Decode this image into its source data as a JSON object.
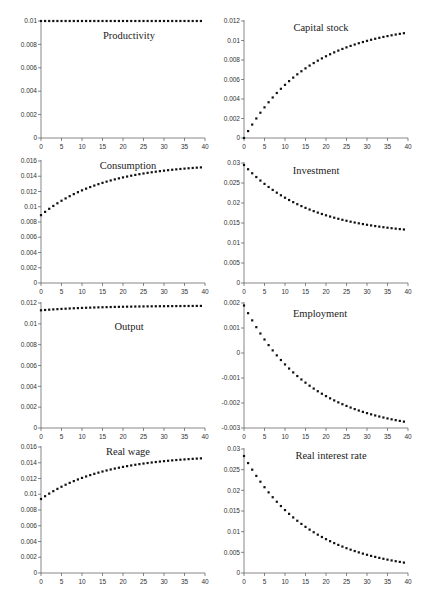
{
  "figure": {
    "layout": {
      "rows": 4,
      "cols": 2
    }
  },
  "chart_data": [
    {
      "type": "scatter",
      "title": "Productivity",
      "xlabel": "",
      "ylabel": "",
      "xlim": [
        0,
        40
      ],
      "ylim": [
        0,
        0.01
      ],
      "xticks": [
        0,
        5,
        10,
        15,
        20,
        25,
        30,
        35,
        40
      ],
      "yticks": [
        0,
        0.002,
        0.004,
        0.006,
        0.008,
        0.01
      ],
      "ytick_labels": [
        "0",
        "0.002",
        "0.004",
        "0.006",
        "0.008",
        "0.01"
      ],
      "model": {
        "kind": "const",
        "value": 0.01
      }
    },
    {
      "type": "scatter",
      "title": "Capital stock",
      "xlabel": "",
      "ylabel": "",
      "xlim": [
        0,
        40
      ],
      "ylim": [
        0,
        0.012
      ],
      "xticks": [
        0,
        5,
        10,
        15,
        20,
        25,
        30,
        35,
        40
      ],
      "yticks": [
        0,
        0.002,
        0.004,
        0.006,
        0.008,
        0.01,
        0.012
      ],
      "ytick_labels": [
        "0",
        "0.002",
        "0.004",
        "0.006",
        "0.008",
        "0.01",
        "0.012"
      ],
      "model": {
        "kind": "exp",
        "start": 0.0,
        "end": 0.0118,
        "rate": 0.062
      }
    },
    {
      "type": "scatter",
      "title": "Consumption",
      "xlabel": "",
      "ylabel": "",
      "xlim": [
        0,
        40
      ],
      "ylim": [
        0,
        0.016
      ],
      "xticks": [
        0,
        5,
        10,
        15,
        20,
        25,
        30,
        35,
        40
      ],
      "yticks": [
        0,
        0.002,
        0.004,
        0.006,
        0.008,
        0.01,
        0.012,
        0.014,
        0.016
      ],
      "ytick_labels": [
        "0",
        "0.002",
        "0.004",
        "0.006",
        "0.008",
        "0.01",
        "0.012",
        "0.014",
        "0.016"
      ],
      "model": {
        "kind": "exp",
        "start": 0.0089,
        "end": 0.0157,
        "rate": 0.065
      }
    },
    {
      "type": "scatter",
      "title": "Investment",
      "xlabel": "",
      "ylabel": "",
      "xlim": [
        0,
        40
      ],
      "ylim": [
        0,
        0.03
      ],
      "xticks": [
        0,
        5,
        10,
        15,
        20,
        25,
        30,
        35,
        40
      ],
      "yticks": [
        0,
        0.005,
        0.01,
        0.015,
        0.02,
        0.025,
        0.03
      ],
      "ytick_labels": [
        "0",
        "0.005",
        "0.01",
        "0.015",
        "0.02",
        "0.025",
        "0.03"
      ],
      "model": {
        "kind": "exp",
        "start": 0.0295,
        "end": 0.0118,
        "rate": 0.062
      }
    },
    {
      "type": "scatter",
      "title": "Output",
      "xlabel": "",
      "ylabel": "",
      "xlim": [
        0,
        40
      ],
      "ylim": [
        0,
        0.012
      ],
      "xticks": [
        0,
        5,
        10,
        15,
        20,
        25,
        30,
        35,
        40
      ],
      "yticks": [
        0,
        0.002,
        0.004,
        0.006,
        0.008,
        0.01,
        0.012
      ],
      "ytick_labels": [
        "0",
        "0.002",
        "0.004",
        "0.006",
        "0.008",
        "0.01",
        "0.012"
      ],
      "model": {
        "kind": "exp",
        "start": 0.0113,
        "end": 0.01175,
        "rate": 0.07
      }
    },
    {
      "type": "scatter",
      "title": "Employment",
      "xlabel": "",
      "ylabel": "",
      "xlim": [
        0,
        40
      ],
      "ylim": [
        -0.003,
        0.002
      ],
      "xticks": [
        0,
        5,
        10,
        15,
        20,
        25,
        30,
        35,
        40
      ],
      "yticks": [
        -0.003,
        -0.002,
        -0.001,
        0,
        0.001,
        0.002
      ],
      "ytick_labels": [
        "-0.003",
        "-0.002",
        "-0.001",
        "0",
        "0.001",
        "0.002"
      ],
      "model": {
        "kind": "exp",
        "start": 0.0019,
        "end": -0.0032,
        "rate": 0.062
      }
    },
    {
      "type": "scatter",
      "title": "Real wage",
      "xlabel": "",
      "ylabel": "",
      "xlim": [
        0,
        40
      ],
      "ylim": [
        0,
        0.016
      ],
      "xticks": [
        0,
        5,
        10,
        15,
        20,
        25,
        30,
        35,
        40
      ],
      "yticks": [
        0,
        0.002,
        0.004,
        0.006,
        0.008,
        0.01,
        0.012,
        0.014,
        0.016
      ],
      "ytick_labels": [
        "0",
        "0.002",
        "0.004",
        "0.006",
        "0.008",
        "0.01",
        "0.012",
        "0.014",
        "0.016"
      ],
      "model": {
        "kind": "exp",
        "start": 0.0094,
        "end": 0.015,
        "rate": 0.065
      }
    },
    {
      "type": "scatter",
      "title": "Real interest rate",
      "xlabel": "",
      "ylabel": "",
      "xlim": [
        0,
        40
      ],
      "ylim": [
        0,
        0.03
      ],
      "xticks": [
        0,
        5,
        10,
        15,
        20,
        25,
        30,
        35,
        40
      ],
      "yticks": [
        0,
        0.005,
        0.01,
        0.015,
        0.02,
        0.025,
        0.03
      ],
      "ytick_labels": [
        "0",
        "0.005",
        "0.01",
        "0.015",
        "0.02",
        "0.025",
        "0.03"
      ],
      "model": {
        "kind": "exp",
        "start": 0.0283,
        "end": 0.0,
        "rate": 0.062
      }
    }
  ]
}
